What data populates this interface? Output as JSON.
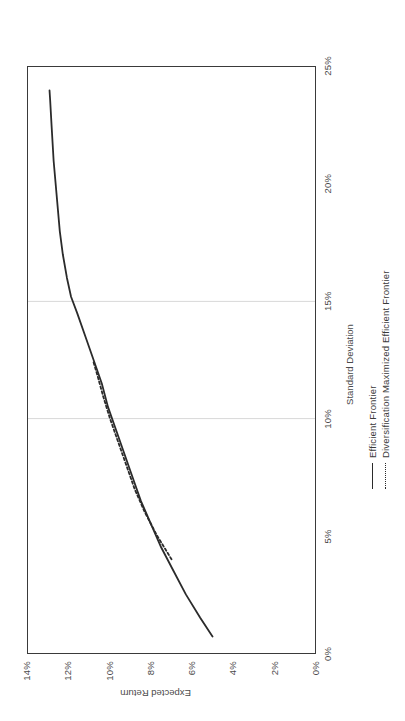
{
  "chart_data": {
    "type": "line",
    "title": "",
    "xlabel": "Standard Deviation",
    "ylabel": "Expected Return",
    "xlim": [
      0,
      25
    ],
    "ylim": [
      0,
      14
    ],
    "xticks": [
      "0%",
      "5%",
      "10%",
      "15%",
      "20%",
      "25%"
    ],
    "xtick_values": [
      0,
      5,
      10,
      15,
      20,
      25
    ],
    "yticks": [
      "0%",
      "2%",
      "4%",
      "6%",
      "8%",
      "10%",
      "12%",
      "14%"
    ],
    "ytick_values": [
      0,
      2,
      4,
      6,
      8,
      10,
      12,
      14
    ],
    "grid": "vertical gridlines at 10% and 15% standard deviation",
    "gridline_values": [
      10,
      15
    ],
    "legend_position": "below axis, center",
    "series": [
      {
        "name": "Efficient Frontier",
        "style": "solid",
        "color": "#2b2b2b",
        "x": [
          0.7,
          1.5,
          2.5,
          3.5,
          4.5,
          5.5,
          6.5,
          7.5,
          8.5,
          9.5,
          10.5,
          11.5,
          12.5,
          13.5,
          14.5,
          15.2,
          16.0,
          17.0,
          18.0,
          19.5,
          21.0,
          22.5,
          23.6,
          24.0
        ],
        "y": [
          5.0,
          5.6,
          6.3,
          6.9,
          7.5,
          8.0,
          8.5,
          8.9,
          9.3,
          9.7,
          10.1,
          10.4,
          10.8,
          11.2,
          11.6,
          11.9,
          12.1,
          12.3,
          12.45,
          12.6,
          12.75,
          12.85,
          12.92,
          12.95
        ]
      },
      {
        "name": "Diversification Maximized Efficient Frontier",
        "style": "dashed",
        "color": "#2b2b2b",
        "x": [
          4.0,
          5.0,
          6.0,
          7.0,
          8.0,
          9.0,
          10.0,
          11.0,
          11.8,
          12.4
        ],
        "y": [
          7.0,
          7.7,
          8.3,
          8.8,
          9.2,
          9.6,
          10.0,
          10.35,
          10.6,
          10.8
        ]
      }
    ]
  },
  "legend": {
    "items": [
      {
        "label": "Efficient Frontier",
        "style": "solid"
      },
      {
        "label": "Diversification Maximized Efficient Frontier",
        "style": "dashed"
      }
    ]
  },
  "axes": {
    "x_title": "Standard Deviation",
    "y_title": "Expected Return"
  }
}
